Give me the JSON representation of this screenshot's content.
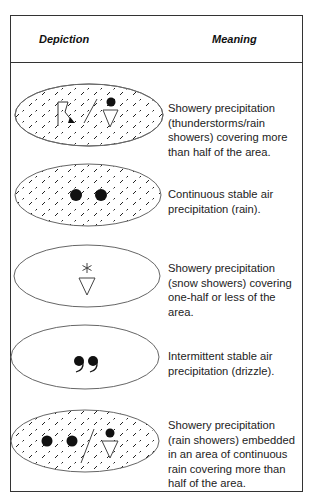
{
  "header": {
    "depiction": "Depiction",
    "meaning": "Meaning"
  },
  "rows": [
    {
      "symbols": [
        "hatched-area",
        "thunderstorm-arrow",
        "slash-separator",
        "rain-shower-triangle"
      ],
      "meaning": "Showery precipitation (thunderstorms/rain showers) covering more than half of the area."
    },
    {
      "symbols": [
        "hatched-area",
        "rain-dot",
        "rain-dot"
      ],
      "meaning": "Continuous stable air precipitation (rain)."
    },
    {
      "symbols": [
        "snow-asterisk",
        "shower-triangle"
      ],
      "meaning": "Showery precipitation (snow showers) covering one-half or less of the area."
    },
    {
      "symbols": [
        "drizzle-comma",
        "drizzle-comma"
      ],
      "meaning": "Intermittent stable air precipitation (drizzle)."
    },
    {
      "symbols": [
        "hatched-area",
        "rain-dot",
        "rain-dot",
        "slash-separator",
        "rain-shower-triangle"
      ],
      "meaning": "Showery precipitation (rain showers) embedded in an area of continuous rain covering more than half of the area."
    }
  ]
}
